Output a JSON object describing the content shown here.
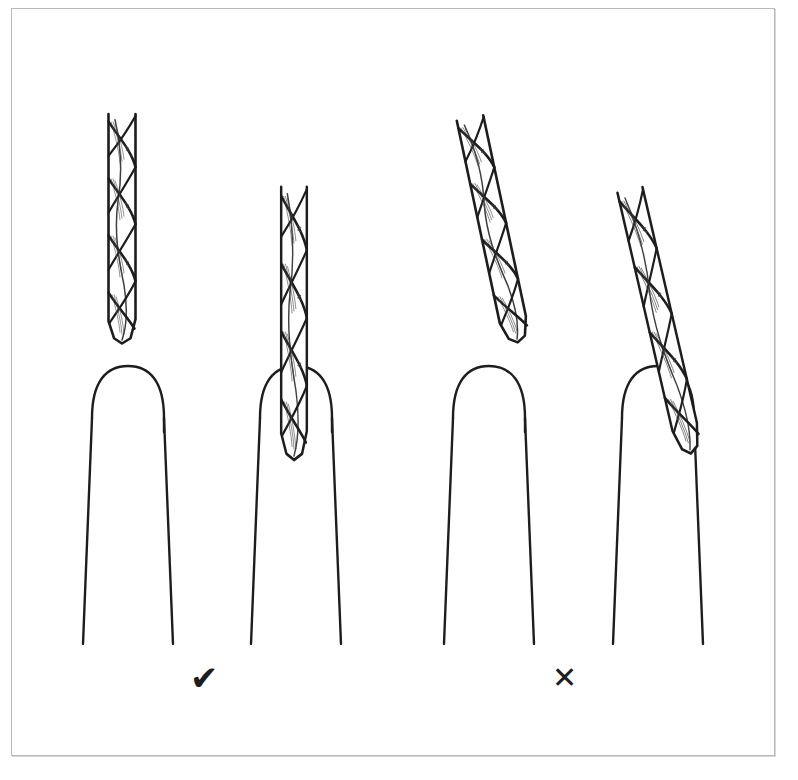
{
  "figure": {
    "background_color": "#ffffff",
    "ink_color": "#1d1d1d",
    "frame_color": "#b8b8b8",
    "width": 798,
    "height": 780
  },
  "panels": [
    {
      "id": "correct",
      "verdict_symbol": "✔",
      "verdict_meaning": "correct",
      "drill_angle_degrees": 0,
      "items": [
        {
          "name": "drill-bit-upright-detached",
          "state": "vertical, held above the finger"
        },
        {
          "name": "finger-empty",
          "state": "finger without drill bit"
        },
        {
          "name": "drill-bit-upright-inserted",
          "state": "vertical, inserted straight into finger"
        },
        {
          "name": "finger-with-drill",
          "state": "finger holding the drill bit straight"
        }
      ]
    },
    {
      "id": "incorrect",
      "verdict_symbol": "✕",
      "verdict_meaning": "incorrect",
      "drill_angle_degrees": 12,
      "items": [
        {
          "name": "drill-bit-tilted-detached",
          "state": "tilted, held above the finger"
        },
        {
          "name": "finger-empty",
          "state": "finger without drill bit"
        },
        {
          "name": "drill-bit-tilted-inserted",
          "state": "tilted, inserted at an angle into finger"
        },
        {
          "name": "finger-with-drill",
          "state": "finger holding the drill bit at an angle"
        }
      ]
    }
  ],
  "symbols": {
    "check": "✔",
    "cross": "✕"
  }
}
